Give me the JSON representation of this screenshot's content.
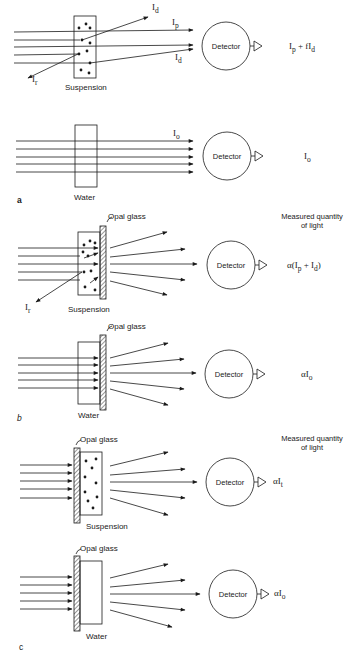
{
  "figure": {
    "panels": [
      {
        "id": "a",
        "label": "a",
        "top": {
          "sample_label": "Suspension",
          "detector_label": "Detector",
          "beam_labels": {
            "incident_scatter_up": "Id",
            "primary": "Ip",
            "forward_scatter": "Id",
            "reflected": "Ir"
          },
          "measured": "Ip + fId"
        },
        "bottom": {
          "sample_label": "Water",
          "detector_label": "Detector",
          "beam_labels": {
            "primary": "Io"
          },
          "measured": "Io"
        }
      },
      {
        "id": "b",
        "label": "b",
        "header": "Measured quantity of light",
        "top": {
          "sample_label": "Suspension",
          "glass_label": "Opal glass",
          "detector_label": "Detector",
          "beam_labels": {
            "reflected": "Ir"
          },
          "measured": "α(Ip + Id)"
        },
        "bottom": {
          "sample_label": "Water",
          "glass_label": "Opal glass",
          "detector_label": "Detector",
          "measured": "αIo"
        }
      },
      {
        "id": "c",
        "label": "c",
        "header": "Measured quantity of light",
        "top": {
          "sample_label": "Suspension",
          "glass_label": "Opal glass",
          "detector_label": "Detector",
          "measured": "αIt"
        },
        "bottom": {
          "sample_label": "Water",
          "glass_label": "Opal glass",
          "detector_label": "Detector",
          "measured": "αIo"
        }
      }
    ],
    "text": {
      "I": "I",
      "sub_d": "d",
      "sub_p": "p",
      "sub_r": "r",
      "sub_o": "o",
      "sub_t": "t",
      "plus_f": " + fI",
      "alpha": "α",
      "paren_open": "(I",
      "plus": " + I",
      "paren_close": ")",
      "mq_line1": "Measured quantity",
      "mq_line2": "of light"
    }
  }
}
